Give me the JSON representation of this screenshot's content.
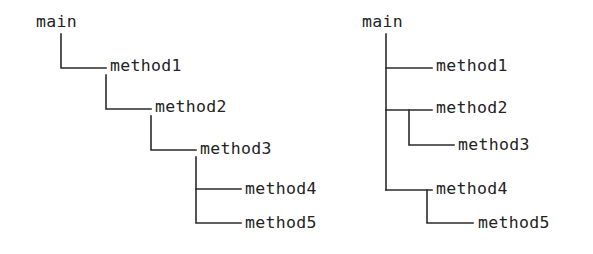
{
  "figure": {
    "background_color": "#ffffff",
    "line_color": "#2b2b2b",
    "text_color": "#232323",
    "width": 593,
    "height": 254
  },
  "diagrams": [
    {
      "id": "left-call-tree",
      "style": "staircase",
      "nodes": [
        {
          "id": "l-main",
          "label": "main",
          "x": 36,
          "y": 27,
          "depth": 0
        },
        {
          "id": "l-method1",
          "label": "method1",
          "x": 110,
          "y": 71,
          "depth": 1
        },
        {
          "id": "l-method2",
          "label": "method2",
          "x": 155,
          "y": 112,
          "depth": 2
        },
        {
          "id": "l-method3",
          "label": "method3",
          "x": 200,
          "y": 154,
          "depth": 3
        },
        {
          "id": "l-method4",
          "label": "method4",
          "x": 245,
          "y": 194,
          "depth": 4
        },
        {
          "id": "l-method5",
          "label": "method5",
          "x": 245,
          "y": 228,
          "depth": 4
        }
      ],
      "edges": [
        {
          "from": "l-main",
          "to": "l-method1",
          "path": "M 61 34 L 61 68 L 106 68"
        },
        {
          "from": "l-method1",
          "to": "l-method2",
          "path": "M 106 75 L 106 109 L 151 109"
        },
        {
          "from": "l-method2",
          "to": "l-method3",
          "path": "M 151 116 L 151 150 L 196 150"
        },
        {
          "from": "l-method3",
          "to": "l-method4",
          "path": "M 196 157 L 196 189 L 241 189"
        },
        {
          "from": "l-method3",
          "to": "l-method5",
          "path": "M 196 189 L 196 223 L 241 223"
        }
      ]
    },
    {
      "id": "right-call-tree",
      "style": "indented-trunk",
      "nodes": [
        {
          "id": "r-main",
          "label": "main",
          "x": 362,
          "y": 27,
          "depth": 0
        },
        {
          "id": "r-method1",
          "label": "method1",
          "x": 436,
          "y": 71,
          "depth": 1
        },
        {
          "id": "r-method2",
          "label": "method2",
          "x": 436,
          "y": 113,
          "depth": 1
        },
        {
          "id": "r-method3",
          "label": "method3",
          "x": 458,
          "y": 150,
          "depth": 2
        },
        {
          "id": "r-method4",
          "label": "method4",
          "x": 436,
          "y": 194,
          "depth": 1
        },
        {
          "id": "r-method5",
          "label": "method5",
          "x": 478,
          "y": 228,
          "depth": 2
        }
      ],
      "edges": [
        {
          "from": "r-main",
          "to": "trunk",
          "path": "M 386 34 L 386 190"
        },
        {
          "from": "r-main",
          "to": "r-method1",
          "path": "M 386 68 L 432 68"
        },
        {
          "from": "r-main",
          "to": "r-method2",
          "path": "M 386 110 L 432 110"
        },
        {
          "from": "r-method2",
          "to": "r-method3",
          "path": "M 409 110 L 409 145 L 454 145"
        },
        {
          "from": "r-main",
          "to": "r-method4",
          "path": "M 386 190 L 432 190"
        },
        {
          "from": "r-method4",
          "to": "r-method5",
          "path": "M 427 190 L 427 223 L 473 223"
        }
      ]
    }
  ]
}
